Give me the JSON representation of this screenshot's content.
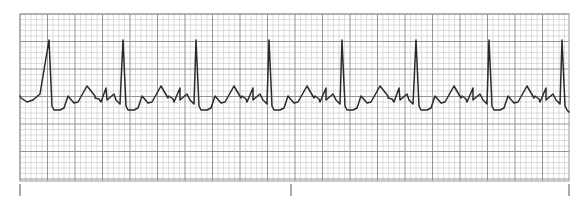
{
  "chart_data": {
    "type": "line",
    "title": "",
    "xlabel": "",
    "ylabel": "",
    "grid": true,
    "legend": null,
    "grid_spec": {
      "small_square_px": 5.5,
      "large_square_px": 27.5,
      "minor_color": "#c8c8c8",
      "major_color": "#8a8a8a"
    },
    "strip_bounds_px": {
      "left": 20,
      "top": 14,
      "right": 569,
      "bottom": 181
    },
    "baseline_y_px": 97,
    "r_peak_x_px": [
      49,
      123,
      196,
      269,
      342,
      416,
      489,
      562
    ],
    "rr_interval_px": 73.3,
    "beat_template": {
      "comment": "offsets relative to R-peak x; y absolute pixels",
      "points": [
        [
          -28,
          98
        ],
        [
          -22,
          102
        ],
        [
          -16,
          100
        ],
        [
          -9,
          94
        ],
        [
          0,
          40
        ],
        [
          3,
          106
        ],
        [
          5,
          110
        ],
        [
          11,
          110
        ],
        [
          15,
          108
        ],
        [
          19,
          96
        ],
        [
          25,
          103
        ],
        [
          29,
          102
        ],
        [
          38,
          86
        ],
        [
          46,
          96
        ],
        [
          50,
          99
        ],
        [
          57,
          88
        ],
        [
          67,
          100
        ],
        [
          71,
          104
        ],
        [
          73.3,
          40
        ]
      ]
    },
    "flutter_wave_period_px": 18,
    "time_markers_x_px": [
      20,
      291,
      569
    ],
    "trace_color": "#2a2a2a"
  },
  "markers": [
    {
      "label": "start-tick"
    },
    {
      "label": "mid-tick"
    },
    {
      "label": "end-tick"
    }
  ]
}
